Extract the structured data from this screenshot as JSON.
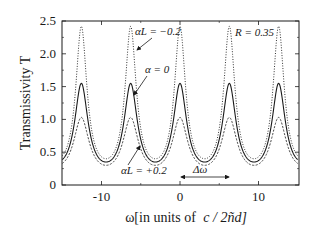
{
  "chart_data": {
    "type": "line",
    "title": "",
    "xlabel": "ω[in units of  c / 2ñd]",
    "ylabel": "Transmissivity T",
    "xlim": [
      -15,
      15
    ],
    "ylim": [
      0,
      2.5
    ],
    "x_ticks": [
      -10,
      0,
      10
    ],
    "x_tick_labels": [
      "-10",
      "0",
      "10"
    ],
    "y_ticks": [
      0,
      0.5,
      1.0,
      1.5,
      2.0,
      2.5
    ],
    "y_tick_labels": [
      "0",
      "0.5",
      "1.0",
      "1.5",
      "2.0",
      "2.5"
    ],
    "grid": false,
    "legend": null,
    "period": 6.283,
    "peak_positions": [
      -12.57,
      -6.28,
      0,
      6.28,
      12.57
    ],
    "series": [
      {
        "name": "αL = -0.2",
        "style": "dotted",
        "peak": 2.42,
        "valley": 0.4
      },
      {
        "name": "α = 0",
        "style": "solid",
        "peak": 1.55,
        "valley": 0.35
      },
      {
        "name": "αL = +0.2",
        "style": "dashed",
        "peak": 1.03,
        "valley": 0.3
      }
    ],
    "annotations": [
      {
        "text": "αL = −0.2",
        "points_to": "dotted peak near ω≈-6.3, T≈2.0"
      },
      {
        "text": "α = 0",
        "points_to": "solid curve near ω≈-6.3, T≈1.4"
      },
      {
        "text": "αL = +0.2",
        "points_to": "dashed curve near ω≈-3, T≈0.6"
      },
      {
        "text": "R = 0.35",
        "position": "upper right"
      },
      {
        "text": "Δω",
        "description": "double arrow from ω=0 to ω≈6.3 spanning one period"
      }
    ]
  },
  "labels": {
    "ylabel": "Transmissivity T",
    "xlabel_prefix": "ω[in units of",
    "xlabel_unit": "c / 2ñd]",
    "annot_neg": "αL = −0.2",
    "annot_zero": "α = 0",
    "annot_pos": "αL = +0.2",
    "annot_R": "R = 0.35",
    "annot_delta": "Δω"
  }
}
